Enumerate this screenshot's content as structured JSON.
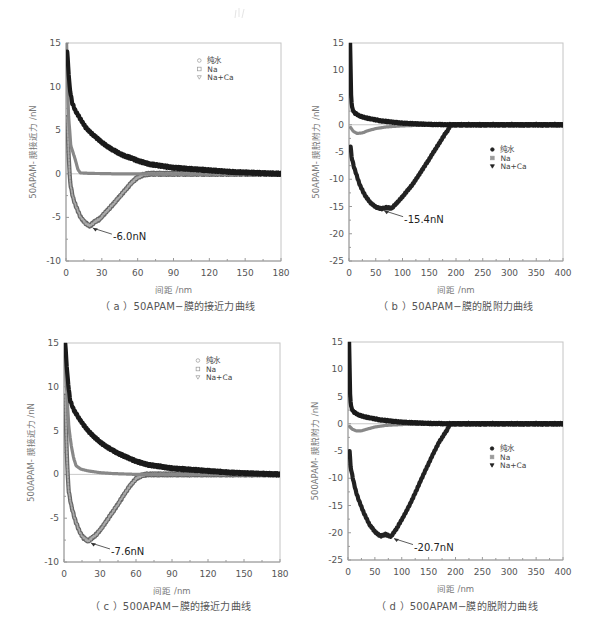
{
  "figure": {
    "captions": [
      "（ a ）50APAM−膜的接近力曲线",
      "（ b ）50APAM−膜的脱附力曲线",
      "（ c ）500APAM−膜的接近力曲线",
      "（ d ）500APAM−膜的脱附力曲线"
    ]
  },
  "chart_data": [
    {
      "id": "a",
      "type": "scatter",
      "title": "（ a ）50APAM−膜的接近力曲线",
      "xlabel": "间距 /nm",
      "ylabel": "50APAM- 膜接近力 /nN",
      "xlim": [
        0,
        180
      ],
      "ylim": [
        -10,
        15
      ],
      "xticks": [
        0,
        30,
        60,
        90,
        120,
        150,
        180
      ],
      "yticks": [
        -10,
        -5,
        0,
        5,
        10,
        15
      ],
      "grid": false,
      "legend": {
        "position": "upper-right",
        "entries": [
          "纯水",
          "Na",
          "Na+Ca"
        ],
        "markers": [
          "circle-open",
          "square-open",
          "triangle-down-open"
        ]
      },
      "annotation": {
        "text": "-6.0nN",
        "x": 20,
        "y": -6.0
      },
      "series": [
        {
          "name": "纯水",
          "color": "#1a1a1a",
          "x": [
            1,
            3,
            5,
            8,
            12,
            16,
            20,
            25,
            30,
            35,
            40,
            45,
            50,
            55,
            60,
            65,
            70,
            80,
            90,
            100,
            110,
            120,
            130,
            140,
            150,
            160,
            170,
            180
          ],
          "y": [
            14,
            10,
            8.2,
            7.2,
            6.3,
            5.4,
            4.8,
            4.2,
            3.6,
            3.1,
            2.7,
            2.3,
            2.0,
            1.8,
            1.5,
            1.3,
            1.1,
            0.9,
            0.7,
            0.6,
            0.5,
            0.4,
            0.3,
            0.2,
            0.15,
            0.1,
            0.05,
            0.0
          ]
        },
        {
          "name": "Na",
          "color": "#888888",
          "x": [
            0.5,
            2,
            4,
            6,
            8,
            10,
            12,
            20,
            40,
            60,
            90,
            120,
            150,
            180
          ],
          "y": [
            15,
            7,
            3.2,
            2.4,
            1.5,
            0.5,
            0.1,
            0.05,
            0.0,
            0.0,
            0.0,
            0.0,
            0.0,
            0.0
          ]
        },
        {
          "name": "Na+Ca",
          "color": "#555555",
          "x": [
            1,
            2,
            3,
            4,
            6,
            8,
            10,
            12,
            14,
            16,
            18,
            20,
            24,
            28,
            32,
            36,
            40,
            45,
            50,
            55,
            60,
            65,
            70,
            90,
            120,
            150,
            180
          ],
          "y": [
            6.5,
            3.0,
            0.0,
            -1.5,
            -2.8,
            -3.6,
            -4.3,
            -4.9,
            -5.3,
            -5.6,
            -5.8,
            -6.0,
            -5.5,
            -5.2,
            -4.6,
            -4.0,
            -3.4,
            -2.6,
            -1.8,
            -1.0,
            -0.4,
            -0.1,
            0.0,
            0.0,
            0.0,
            0.0,
            0.0
          ]
        }
      ]
    },
    {
      "id": "b",
      "type": "scatter",
      "title": "（ b ）50APAM−膜的脱附力曲线",
      "xlabel": "间距 /nm",
      "ylabel": "50APAM- 膜脱附力 /nN",
      "xlim": [
        0,
        400
      ],
      "ylim": [
        -25,
        15
      ],
      "xticks": [
        0,
        50,
        100,
        150,
        200,
        250,
        300,
        350,
        400
      ],
      "yticks": [
        -25,
        -20,
        -15,
        -10,
        -5,
        0,
        5,
        10,
        15
      ],
      "grid": false,
      "legend": {
        "position": "center-right",
        "entries": [
          "纯水",
          "Na",
          "Na+Ca"
        ],
        "markers": [
          "circle-filled",
          "square-filled",
          "triangle-down-filled"
        ]
      },
      "annotation": {
        "text": "-15.4nN",
        "x": 60,
        "y": -15.4
      },
      "series": [
        {
          "name": "纯水",
          "color": "#1a1a1a",
          "x": [
            2,
            4,
            6,
            10,
            20,
            30,
            40,
            50,
            60,
            80,
            100,
            130,
            160,
            190,
            250,
            300,
            350,
            400
          ],
          "y": [
            15,
            5,
            3,
            2.2,
            1.6,
            1.3,
            1.1,
            0.9,
            0.7,
            0.5,
            0.3,
            0.15,
            0.05,
            0.0,
            0.0,
            0.0,
            0.0,
            0.0
          ]
        },
        {
          "name": "Na",
          "color": "#888888",
          "x": [
            3,
            8,
            15,
            25,
            35,
            50,
            70,
            100,
            150,
            190,
            250,
            400
          ],
          "y": [
            -0.5,
            -1.2,
            -1.6,
            -1.5,
            -1.1,
            -0.7,
            -0.4,
            -0.2,
            -0.05,
            0.0,
            0.0,
            0.0
          ]
        },
        {
          "name": "Na+Ca",
          "color": "#222222",
          "x": [
            3,
            5,
            10,
            15,
            20,
            30,
            40,
            50,
            60,
            70,
            80,
            90,
            100,
            110,
            120,
            130,
            140,
            150,
            160,
            170,
            180,
            185,
            190,
            250,
            300,
            350,
            400
          ],
          "y": [
            -4,
            -6,
            -8,
            -9.5,
            -11,
            -13,
            -14.3,
            -15.1,
            -15.4,
            -15.2,
            -15.3,
            -14.3,
            -13.2,
            -12.0,
            -10.8,
            -9.3,
            -7.8,
            -6.3,
            -4.7,
            -3.2,
            -1.6,
            -1.0,
            0.0,
            0.0,
            0.0,
            0.0,
            0.0
          ]
        }
      ]
    },
    {
      "id": "c",
      "type": "scatter",
      "title": "（ c ）500APAM−膜的接近力曲线",
      "xlabel": "间距 /nm",
      "ylabel": "500APAM- 膜接近力 /nN",
      "xlim": [
        0,
        180
      ],
      "ylim": [
        -10,
        15
      ],
      "xticks": [
        0,
        30,
        60,
        90,
        120,
        150,
        180
      ],
      "yticks": [
        -10,
        -5,
        0,
        5,
        10,
        15
      ],
      "grid": false,
      "legend": {
        "position": "upper-right",
        "entries": [
          "纯水",
          "Na",
          "Na+Ca"
        ],
        "markers": [
          "circle-open",
          "square-open",
          "triangle-down-open"
        ]
      },
      "annotation": {
        "text": "-7.6nN",
        "x": 20,
        "y": -7.6
      },
      "series": [
        {
          "name": "纯水",
          "color": "#1a1a1a",
          "x": [
            1,
            3,
            5,
            8,
            12,
            16,
            20,
            25,
            30,
            35,
            40,
            45,
            50,
            55,
            60,
            65,
            70,
            80,
            90,
            100,
            110,
            120,
            130,
            140,
            150,
            160,
            170,
            180
          ],
          "y": [
            15,
            11,
            8.5,
            7.4,
            6.5,
            5.7,
            5.0,
            4.3,
            3.7,
            3.2,
            2.8,
            2.4,
            2.1,
            1.8,
            1.5,
            1.3,
            1.1,
            0.9,
            0.7,
            0.6,
            0.5,
            0.4,
            0.3,
            0.2,
            0.15,
            0.1,
            0.05,
            0.0
          ]
        },
        {
          "name": "Na",
          "color": "#888888",
          "x": [
            0.5,
            2,
            4,
            6,
            8,
            10,
            14,
            20,
            30,
            40,
            60,
            90,
            120,
            150,
            180
          ],
          "y": [
            14,
            10,
            5.5,
            3.3,
            1.9,
            1.0,
            0.6,
            0.4,
            0.2,
            0.1,
            0.0,
            0.0,
            0.0,
            0.0,
            0.0
          ]
        },
        {
          "name": "Na+Ca",
          "color": "#555555",
          "x": [
            1,
            2,
            3,
            4,
            6,
            8,
            10,
            12,
            14,
            16,
            18,
            20,
            24,
            28,
            32,
            36,
            40,
            45,
            50,
            55,
            60,
            65,
            70,
            90,
            120,
            150,
            180
          ],
          "y": [
            9,
            4.0,
            0.0,
            -2.0,
            -3.5,
            -4.6,
            -5.5,
            -6.2,
            -6.8,
            -7.2,
            -7.4,
            -7.6,
            -7.2,
            -6.7,
            -6.0,
            -5.2,
            -4.4,
            -3.4,
            -2.3,
            -1.3,
            -0.5,
            -0.1,
            0.0,
            0.0,
            0.0,
            0.0,
            0.0
          ]
        }
      ]
    },
    {
      "id": "d",
      "type": "scatter",
      "title": "（ d ）500APAM−膜的脱附力曲线",
      "xlabel": "间距 /nm",
      "ylabel": "500APAM- 膜脱附力 /nN",
      "xlim": [
        0,
        400
      ],
      "ylim": [
        -25,
        15
      ],
      "xticks": [
        0,
        50,
        100,
        150,
        200,
        250,
        300,
        350,
        400
      ],
      "yticks": [
        -25,
        -20,
        -15,
        -10,
        -5,
        0,
        5,
        10,
        15
      ],
      "grid": false,
      "legend": {
        "position": "center-right",
        "entries": [
          "纯水",
          "Na",
          "Na+Ca"
        ],
        "markers": [
          "circle-filled",
          "square-filled",
          "triangle-down-filled"
        ]
      },
      "annotation": {
        "text": "-20.7nN",
        "x": 80,
        "y": -20.7
      },
      "series": [
        {
          "name": "纯水",
          "color": "#1a1a1a",
          "x": [
            2,
            4,
            6,
            10,
            20,
            30,
            40,
            50,
            60,
            80,
            100,
            130,
            160,
            190,
            250,
            300,
            350,
            400
          ],
          "y": [
            15,
            5,
            3,
            2.2,
            1.6,
            1.3,
            1.1,
            0.9,
            0.7,
            0.5,
            0.3,
            0.15,
            0.05,
            0.0,
            0.0,
            0.0,
            0.0,
            0.0
          ]
        },
        {
          "name": "Na",
          "color": "#888888",
          "x": [
            3,
            8,
            15,
            25,
            35,
            50,
            70,
            100,
            150,
            190,
            250,
            400
          ],
          "y": [
            -0.5,
            -1.0,
            -1.3,
            -1.3,
            -1.0,
            -0.6,
            -0.3,
            -0.15,
            -0.05,
            0.0,
            0.0,
            0.0
          ]
        },
        {
          "name": "Na+Ca",
          "color": "#222222",
          "x": [
            3,
            5,
            10,
            15,
            20,
            30,
            40,
            50,
            60,
            70,
            80,
            90,
            100,
            110,
            120,
            130,
            140,
            150,
            160,
            170,
            180,
            185,
            190,
            250,
            300,
            350,
            400
          ],
          "y": [
            -5,
            -8,
            -10.5,
            -12.5,
            -14,
            -16.5,
            -18.5,
            -19.8,
            -20.6,
            -20.3,
            -20.7,
            -19.3,
            -17.6,
            -15.8,
            -13.8,
            -11.6,
            -9.4,
            -7.3,
            -5.2,
            -3.3,
            -1.8,
            -1.0,
            0.0,
            0.0,
            0.0,
            0.0,
            0.0
          ]
        }
      ]
    }
  ]
}
